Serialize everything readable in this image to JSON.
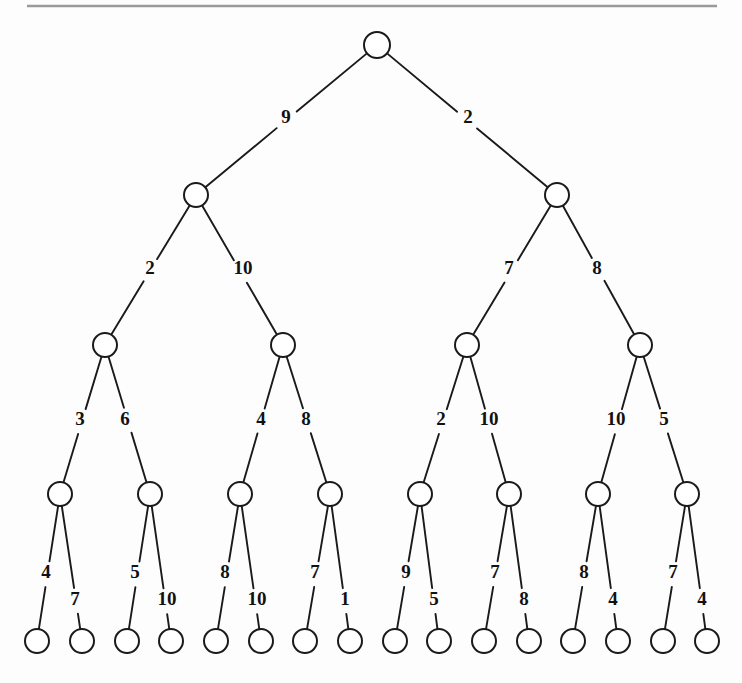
{
  "figure": {
    "type": "binary-tree-diagram",
    "title": "",
    "background_color": "#fdfdfd",
    "ink_color": "#1a1a1a",
    "rule_color": "#9a9a9a",
    "node_count": 31,
    "leaf_count": 16,
    "depth": 5,
    "rule": {
      "x1": 27,
      "y1": 6,
      "x2": 717,
      "y2": 6
    }
  },
  "nodes": [
    {
      "id": "n0",
      "level": 0,
      "x": 377,
      "y": 45,
      "r": 13
    },
    {
      "id": "n0-L",
      "level": 1,
      "x": 196,
      "y": 195,
      "r": 12
    },
    {
      "id": "n0-R",
      "level": 1,
      "x": 557,
      "y": 195,
      "r": 12
    },
    {
      "id": "n0-LL",
      "level": 2,
      "x": 105,
      "y": 345,
      "r": 12
    },
    {
      "id": "n0-LR",
      "level": 2,
      "x": 283,
      "y": 345,
      "r": 12
    },
    {
      "id": "n0-RL",
      "level": 2,
      "x": 467,
      "y": 345,
      "r": 12
    },
    {
      "id": "n0-RR",
      "level": 2,
      "x": 640,
      "y": 345,
      "r": 12
    },
    {
      "id": "n0-LLL",
      "level": 3,
      "x": 60,
      "y": 494,
      "r": 12
    },
    {
      "id": "n0-LLR",
      "level": 3,
      "x": 150,
      "y": 494,
      "r": 12
    },
    {
      "id": "n0-LRL",
      "level": 3,
      "x": 240,
      "y": 494,
      "r": 12
    },
    {
      "id": "n0-LRR",
      "level": 3,
      "x": 330,
      "y": 494,
      "r": 12
    },
    {
      "id": "n0-RLL",
      "level": 3,
      "x": 420,
      "y": 494,
      "r": 12
    },
    {
      "id": "n0-RLR",
      "level": 3,
      "x": 509,
      "y": 494,
      "r": 12
    },
    {
      "id": "n0-RRL",
      "level": 3,
      "x": 598,
      "y": 494,
      "r": 12
    },
    {
      "id": "n0-RRR",
      "level": 3,
      "x": 687,
      "y": 494,
      "r": 12
    },
    {
      "id": "leaf-1",
      "level": 4,
      "x": 37,
      "y": 641,
      "r": 12
    },
    {
      "id": "leaf-2",
      "level": 4,
      "x": 82,
      "y": 641,
      "r": 12
    },
    {
      "id": "leaf-3",
      "level": 4,
      "x": 127,
      "y": 641,
      "r": 12
    },
    {
      "id": "leaf-4",
      "level": 4,
      "x": 171,
      "y": 641,
      "r": 12
    },
    {
      "id": "leaf-5",
      "level": 4,
      "x": 216,
      "y": 641,
      "r": 12
    },
    {
      "id": "leaf-6",
      "level": 4,
      "x": 261,
      "y": 641,
      "r": 12
    },
    {
      "id": "leaf-7",
      "level": 4,
      "x": 305,
      "y": 641,
      "r": 12
    },
    {
      "id": "leaf-8",
      "level": 4,
      "x": 350,
      "y": 641,
      "r": 12
    },
    {
      "id": "leaf-9",
      "level": 4,
      "x": 395,
      "y": 641,
      "r": 12
    },
    {
      "id": "leaf-10",
      "level": 4,
      "x": 439,
      "y": 641,
      "r": 12
    },
    {
      "id": "leaf-11",
      "level": 4,
      "x": 484,
      "y": 641,
      "r": 12
    },
    {
      "id": "leaf-12",
      "level": 4,
      "x": 529,
      "y": 641,
      "r": 12
    },
    {
      "id": "leaf-13",
      "level": 4,
      "x": 573,
      "y": 641,
      "r": 12
    },
    {
      "id": "leaf-14",
      "level": 4,
      "x": 618,
      "y": 641,
      "r": 12
    },
    {
      "id": "leaf-15",
      "level": 4,
      "x": 663,
      "y": 641,
      "r": 12
    },
    {
      "id": "leaf-16",
      "level": 4,
      "x": 707,
      "y": 641,
      "r": 12
    }
  ],
  "edges": [
    {
      "id": "e-0-L",
      "from": "n0",
      "to": "n0-L",
      "label": "9",
      "lx": 286,
      "ly": 119
    },
    {
      "id": "e-0-R",
      "from": "n0",
      "to": "n0-R",
      "label": "2",
      "lx": 468,
      "ly": 119
    },
    {
      "id": "e-L-L",
      "from": "n0-L",
      "to": "n0-LL",
      "label": "2",
      "lx": 150,
      "ly": 270
    },
    {
      "id": "e-L-R",
      "from": "n0-L",
      "to": "n0-LR",
      "label": "10",
      "lx": 243,
      "ly": 270
    },
    {
      "id": "e-R-L",
      "from": "n0-R",
      "to": "n0-RL",
      "label": "7",
      "lx": 509,
      "ly": 270
    },
    {
      "id": "e-R-R",
      "from": "n0-R",
      "to": "n0-RR",
      "label": "8",
      "lx": 597,
      "ly": 270
    },
    {
      "id": "e-LL-L",
      "from": "n0-LL",
      "to": "n0-LLL",
      "label": "3",
      "lx": 80,
      "ly": 421
    },
    {
      "id": "e-LL-R",
      "from": "n0-LL",
      "to": "n0-LLR",
      "label": "6",
      "lx": 125,
      "ly": 421
    },
    {
      "id": "e-LR-L",
      "from": "n0-LR",
      "to": "n0-LRL",
      "label": "4",
      "lx": 261,
      "ly": 421
    },
    {
      "id": "e-LR-R",
      "from": "n0-LR",
      "to": "n0-LRR",
      "label": "8",
      "lx": 306,
      "ly": 421
    },
    {
      "id": "e-RL-L",
      "from": "n0-RL",
      "to": "n0-RLL",
      "label": "2",
      "lx": 441,
      "ly": 421
    },
    {
      "id": "e-RL-R",
      "from": "n0-RL",
      "to": "n0-RLR",
      "label": "10",
      "lx": 489,
      "ly": 421
    },
    {
      "id": "e-RR-L",
      "from": "n0-RR",
      "to": "n0-RRL",
      "label": "10",
      "lx": 616,
      "ly": 421
    },
    {
      "id": "e-RR-R",
      "from": "n0-RR",
      "to": "n0-RRR",
      "label": "5",
      "lx": 664,
      "ly": 421
    },
    {
      "id": "e-LLL-L",
      "from": "n0-LLL",
      "to": "leaf-1",
      "label": "4",
      "lx": 46,
      "ly": 574
    },
    {
      "id": "e-LLL-R",
      "from": "n0-LLL",
      "to": "leaf-2",
      "label": "7",
      "lx": 75,
      "ly": 601
    },
    {
      "id": "e-LLR-L",
      "from": "n0-LLR",
      "to": "leaf-3",
      "label": "5",
      "lx": 135,
      "ly": 574
    },
    {
      "id": "e-LLR-R",
      "from": "n0-LLR",
      "to": "leaf-4",
      "label": "10",
      "lx": 167,
      "ly": 601
    },
    {
      "id": "e-LRL-L",
      "from": "n0-LRL",
      "to": "leaf-5",
      "label": "8",
      "lx": 225,
      "ly": 574
    },
    {
      "id": "e-LRL-R",
      "from": "n0-LRL",
      "to": "leaf-6",
      "label": "10",
      "lx": 257,
      "ly": 601
    },
    {
      "id": "e-LRR-L",
      "from": "n0-LRR",
      "to": "leaf-7",
      "label": "7",
      "lx": 315,
      "ly": 574
    },
    {
      "id": "e-LRR-R",
      "from": "n0-LRR",
      "to": "leaf-8",
      "label": "1",
      "lx": 345,
      "ly": 601
    },
    {
      "id": "e-RLL-L",
      "from": "n0-RLL",
      "to": "leaf-9",
      "label": "9",
      "lx": 406,
      "ly": 574
    },
    {
      "id": "e-RLL-R",
      "from": "n0-RLL",
      "to": "leaf-10",
      "label": "5",
      "lx": 434,
      "ly": 601
    },
    {
      "id": "e-RLR-L",
      "from": "n0-RLR",
      "to": "leaf-11",
      "label": "7",
      "lx": 495,
      "ly": 574
    },
    {
      "id": "e-RLR-R",
      "from": "n0-RLR",
      "to": "leaf-12",
      "label": "8",
      "lx": 524,
      "ly": 601
    },
    {
      "id": "e-RRL-L",
      "from": "n0-RRL",
      "to": "leaf-13",
      "label": "8",
      "lx": 584,
      "ly": 574
    },
    {
      "id": "e-RRL-R",
      "from": "n0-RRL",
      "to": "leaf-14",
      "label": "4",
      "lx": 613,
      "ly": 601
    },
    {
      "id": "e-RRR-L",
      "from": "n0-RRR",
      "to": "leaf-15",
      "label": "7",
      "lx": 673,
      "ly": 574
    },
    {
      "id": "e-RRR-R",
      "from": "n0-RRR",
      "to": "leaf-16",
      "label": "4",
      "lx": 702,
      "ly": 601
    }
  ]
}
